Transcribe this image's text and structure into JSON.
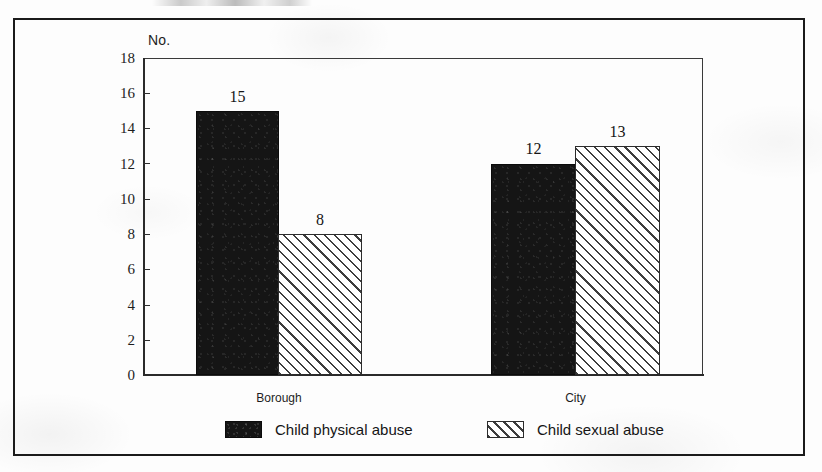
{
  "chart_data": {
    "type": "bar",
    "title": "",
    "subtitle": "",
    "xlabel": "",
    "ylabel": "No.",
    "ylim": [
      0,
      18
    ],
    "y_ticks": [
      0,
      2,
      4,
      6,
      8,
      10,
      12,
      14,
      16,
      18
    ],
    "grid": false,
    "legend_position": "bottom",
    "categories": [
      "Borough",
      "City"
    ],
    "series": [
      {
        "name": "Child physical abuse",
        "pattern": "solid-black",
        "values": [
          15,
          12
        ]
      },
      {
        "name": "Child sexual abuse",
        "pattern": "diagonal-hatch",
        "values": [
          8,
          13
        ]
      }
    ],
    "data_labels": [
      "15",
      "8",
      "12",
      "13"
    ]
  },
  "axes": {
    "y_title": "No.",
    "y_tick_labels": [
      "18",
      "16",
      "14",
      "12",
      "10",
      "8",
      "6",
      "4",
      "2",
      "0"
    ],
    "x_tick_labels": [
      "Borough",
      "City"
    ]
  },
  "bars": [
    {
      "group": "Borough",
      "series": "Child physical abuse",
      "value": 15,
      "label": "15",
      "style": "solid"
    },
    {
      "group": "Borough",
      "series": "Child sexual abuse",
      "value": 8,
      "label": "8",
      "style": "hatched"
    },
    {
      "group": "City",
      "series": "Child physical abuse",
      "value": 12,
      "label": "12",
      "style": "solid"
    },
    {
      "group": "City",
      "series": "Child sexual abuse",
      "value": 13,
      "label": "13",
      "style": "hatched"
    }
  ],
  "legend": {
    "entries": [
      {
        "label": "Child physical abuse",
        "style": "solid"
      },
      {
        "label": "Child sexual abuse",
        "style": "hatched"
      }
    ]
  },
  "colors": {
    "solid_fill": "#151515",
    "hatch_line": "#3d3d3d",
    "hatch_fill": "#ffffff",
    "axis": "#2a2a2a",
    "frame": "#1b1b1b",
    "text": "#1d1d1d",
    "background": "#fdfdfd"
  }
}
